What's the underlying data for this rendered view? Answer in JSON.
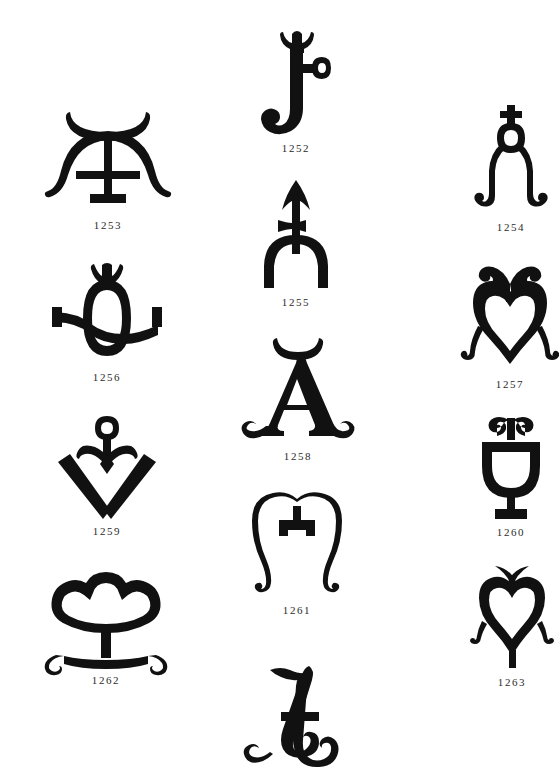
{
  "page": {
    "kind": "plate-of-marks",
    "background_color": "#ffffff",
    "ink_color": "#111111",
    "caption_color": "#2b2b2b",
    "width": 559,
    "height": 775,
    "columns": 3
  },
  "figures": [
    {
      "id": "fig-1252",
      "caption": "1252",
      "icon_name": "hook-with-ring-and-crown-mark-icon",
      "description": "J-shaped hook with crowned finial and small circular ring on the right",
      "column": "center",
      "row": 1,
      "x": 256,
      "y": 26,
      "width": 80,
      "height": 112
    },
    {
      "id": "fig-1253",
      "caption": "1253",
      "icon_name": "crescent-over-a-mark-icon",
      "description": "Letter A with crescent above and outward curling feet",
      "column": "left",
      "row": 1,
      "x": 52,
      "y": 110,
      "width": 112,
      "height": 105
    },
    {
      "id": "fig-1254",
      "caption": "1254",
      "icon_name": "cross-over-ring-with-hooked-legs-icon",
      "description": "Small cross above a ring, two legs curling outward into hooks",
      "column": "right",
      "row": 1,
      "x": 472,
      "y": 105,
      "width": 78,
      "height": 112
    },
    {
      "id": "fig-1255",
      "caption": "1255",
      "icon_name": "arrow-with-crossbar-and-fork-icon",
      "description": "Upward arrow with a crossbar on a forked U-shaped base",
      "column": "center",
      "row": 2,
      "x": 259,
      "y": 180,
      "width": 74,
      "height": 112
    },
    {
      "id": "fig-1256",
      "caption": "1256",
      "icon_name": "crowned-oval-with-crossbar-icon",
      "description": "Vertical oval with a crowned top and a horizontal bar ending in stubs",
      "column": "left",
      "row": 2,
      "x": 46,
      "y": 262,
      "width": 122,
      "height": 105
    },
    {
      "id": "fig-1257",
      "caption": "1257",
      "icon_name": "heart-with-curled-top-and-feet-icon",
      "description": "Heart shape crowned by two inward curls, legs curling outward",
      "column": "right",
      "row": 2,
      "x": 470,
      "y": 262,
      "width": 80,
      "height": 112
    },
    {
      "id": "fig-1258",
      "caption": "1258",
      "icon_name": "roman-a-with-crescent-and-curled-feet-icon",
      "description": "Serif capital A with crescent apex and scroll-curled feet",
      "column": "center",
      "row": 3,
      "x": 248,
      "y": 336,
      "width": 100,
      "height": 110
    },
    {
      "id": "fig-1259",
      "caption": "1259",
      "icon_name": "ring-headed-figure-over-diamond-icon",
      "description": "Small ring head with arms over a V / diamond lozenge",
      "column": "left",
      "row": 3,
      "x": 55,
      "y": 416,
      "width": 104,
      "height": 105
    },
    {
      "id": "fig-1260",
      "caption": "1260",
      "icon_name": "chalice-with-curled-top-icon",
      "description": "Footed chalice or goblet topped by a double curl",
      "column": "right",
      "row": 3,
      "x": 478,
      "y": 416,
      "width": 66,
      "height": 106
    },
    {
      "id": "fig-1261",
      "caption": "1261",
      "icon_name": "double-curl-m-mark-icon",
      "description": "Letter M made of two mirrored scrolls with a central bar",
      "column": "center",
      "row": 4,
      "x": 255,
      "y": 496,
      "width": 84,
      "height": 104
    },
    {
      "id": "fig-1262",
      "caption": "1262",
      "icon_name": "trefoil-cloud-on-stand-icon",
      "description": "Trefoil cloud-shaped outline on a pedestal with curled feet",
      "column": "left",
      "row": 4,
      "x": 48,
      "y": 570,
      "width": 116,
      "height": 100
    },
    {
      "id": "fig-1263",
      "caption": "1263",
      "icon_name": "heart-with-horns-and-hooks-icon",
      "description": "Heart with two horns above and small hooks at the sides",
      "column": "right",
      "row": 4,
      "x": 478,
      "y": 562,
      "width": 68,
      "height": 110
    },
    {
      "id": "fig-script-a",
      "caption": "",
      "icon_name": "script-capital-a-mark-icon",
      "description": "Ornamental italic script capital A with curled terminals, unlabeled at page foot",
      "column": "center",
      "row": 5,
      "x": 250,
      "y": 664,
      "width": 98,
      "height": 104
    }
  ]
}
